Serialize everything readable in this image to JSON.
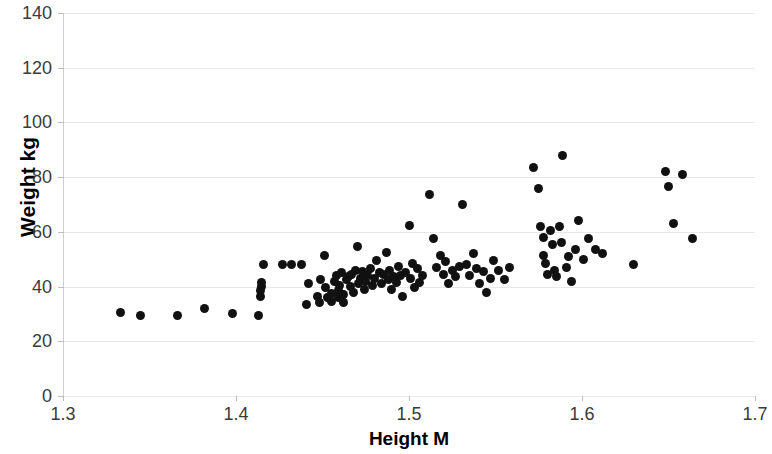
{
  "chart_data": {
    "type": "scatter",
    "title": "",
    "xlabel": "Height M",
    "ylabel": "Weight kg",
    "xlim": [
      1.3,
      1.7
    ],
    "ylim": [
      0,
      140
    ],
    "xticks": [
      "1.3",
      "1.4",
      "1.5",
      "1.6",
      "1.7"
    ],
    "xtick_values": [
      1.3,
      1.4,
      1.5,
      1.6,
      1.7
    ],
    "yticks": [
      "0",
      "20",
      "40",
      "60",
      "80",
      "100",
      "120",
      "140"
    ],
    "ytick_values": [
      0,
      20,
      40,
      60,
      80,
      100,
      120,
      140
    ],
    "grid": true,
    "legend": false,
    "marker_color": "#111111",
    "marker_size": 9,
    "points": [
      [
        1.333,
        30.5
      ],
      [
        1.345,
        29.5
      ],
      [
        1.366,
        29.5
      ],
      [
        1.382,
        32.0
      ],
      [
        1.398,
        30.0
      ],
      [
        1.413,
        29.5
      ],
      [
        1.414,
        36.5
      ],
      [
        1.414,
        38.5
      ],
      [
        1.415,
        40.0
      ],
      [
        1.415,
        41.5
      ],
      [
        1.416,
        48.0
      ],
      [
        1.427,
        48.0
      ],
      [
        1.432,
        48.0
      ],
      [
        1.438,
        48.0
      ],
      [
        1.441,
        33.5
      ],
      [
        1.442,
        41.0
      ],
      [
        1.447,
        36.5
      ],
      [
        1.448,
        34.0
      ],
      [
        1.449,
        42.5
      ],
      [
        1.451,
        51.5
      ],
      [
        1.452,
        39.5
      ],
      [
        1.453,
        36.0
      ],
      [
        1.455,
        34.5
      ],
      [
        1.455,
        37.5
      ],
      [
        1.457,
        42.0
      ],
      [
        1.458,
        44.0
      ],
      [
        1.459,
        36.0
      ],
      [
        1.459,
        38.5
      ],
      [
        1.46,
        40.5
      ],
      [
        1.461,
        45.0
      ],
      [
        1.462,
        34.0
      ],
      [
        1.462,
        37.0
      ],
      [
        1.464,
        42.5
      ],
      [
        1.465,
        43.5
      ],
      [
        1.466,
        40.0
      ],
      [
        1.467,
        44.5
      ],
      [
        1.468,
        38.0
      ],
      [
        1.469,
        46.0
      ],
      [
        1.47,
        54.5
      ],
      [
        1.471,
        41.0
      ],
      [
        1.472,
        43.0
      ],
      [
        1.473,
        45.5
      ],
      [
        1.474,
        39.0
      ],
      [
        1.475,
        42.0
      ],
      [
        1.476,
        44.0
      ],
      [
        1.478,
        46.5
      ],
      [
        1.479,
        40.5
      ],
      [
        1.48,
        43.0
      ],
      [
        1.481,
        49.5
      ],
      [
        1.483,
        45.0
      ],
      [
        1.484,
        41.0
      ],
      [
        1.485,
        44.5
      ],
      [
        1.487,
        52.5
      ],
      [
        1.488,
        42.5
      ],
      [
        1.489,
        46.0
      ],
      [
        1.49,
        39.0
      ],
      [
        1.491,
        43.5
      ],
      [
        1.493,
        41.5
      ],
      [
        1.494,
        47.5
      ],
      [
        1.495,
        44.0
      ],
      [
        1.496,
        36.5
      ],
      [
        1.498,
        45.0
      ],
      [
        1.5,
        62.5
      ],
      [
        1.501,
        43.0
      ],
      [
        1.502,
        48.5
      ],
      [
        1.503,
        39.5
      ],
      [
        1.505,
        46.5
      ],
      [
        1.506,
        41.5
      ],
      [
        1.508,
        44.0
      ],
      [
        1.512,
        73.5
      ],
      [
        1.514,
        57.5
      ],
      [
        1.516,
        47.0
      ],
      [
        1.518,
        51.5
      ],
      [
        1.52,
        44.5
      ],
      [
        1.521,
        49.0
      ],
      [
        1.523,
        41.0
      ],
      [
        1.525,
        46.0
      ],
      [
        1.527,
        43.5
      ],
      [
        1.529,
        47.5
      ],
      [
        1.531,
        70.0
      ],
      [
        1.533,
        48.0
      ],
      [
        1.535,
        44.0
      ],
      [
        1.537,
        52.0
      ],
      [
        1.539,
        46.5
      ],
      [
        1.541,
        41.0
      ],
      [
        1.543,
        45.5
      ],
      [
        1.545,
        38.0
      ],
      [
        1.547,
        43.0
      ],
      [
        1.549,
        49.5
      ],
      [
        1.552,
        46.0
      ],
      [
        1.555,
        42.5
      ],
      [
        1.558,
        47.0
      ],
      [
        1.572,
        83.5
      ],
      [
        1.575,
        76.0
      ],
      [
        1.576,
        62.0
      ],
      [
        1.578,
        58.0
      ],
      [
        1.578,
        51.5
      ],
      [
        1.579,
        48.5
      ],
      [
        1.58,
        44.5
      ],
      [
        1.582,
        60.5
      ],
      [
        1.583,
        55.5
      ],
      [
        1.584,
        46.0
      ],
      [
        1.585,
        43.5
      ],
      [
        1.587,
        62.0
      ],
      [
        1.588,
        56.0
      ],
      [
        1.589,
        88.0
      ],
      [
        1.591,
        47.0
      ],
      [
        1.592,
        51.0
      ],
      [
        1.594,
        42.0
      ],
      [
        1.596,
        53.5
      ],
      [
        1.598,
        64.0
      ],
      [
        1.601,
        50.0
      ],
      [
        1.604,
        57.5
      ],
      [
        1.608,
        53.5
      ],
      [
        1.612,
        52.0
      ],
      [
        1.63,
        48.0
      ],
      [
        1.648,
        82.0
      ],
      [
        1.65,
        76.5
      ],
      [
        1.658,
        81.0
      ],
      [
        1.653,
        63.0
      ],
      [
        1.664,
        57.5
      ]
    ]
  }
}
